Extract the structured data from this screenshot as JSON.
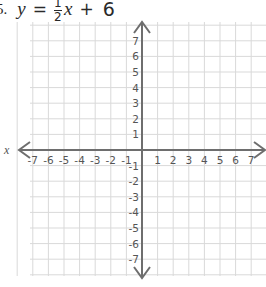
{
  "problem": {
    "number": "5.",
    "lhs": "y",
    "equals": "=",
    "fraction_numerator": "1",
    "fraction_denominator": "2",
    "variable": "x",
    "plus": "+",
    "constant": "6"
  },
  "chart_data": {
    "type": "line",
    "xlabel": "x",
    "ylabel": "",
    "xlim": [
      -7,
      7
    ],
    "ylim": [
      -7,
      7
    ],
    "grid": true,
    "x_ticks": [
      "-7",
      "-6",
      "-5",
      "-4",
      "-3",
      "-2",
      "-1",
      "1",
      "2",
      "3",
      "4",
      "5",
      "6",
      "7"
    ],
    "y_ticks": [
      "7",
      "6",
      "5",
      "4",
      "3",
      "2",
      "1",
      "-1",
      "-2",
      "-3",
      "-4",
      "-5",
      "-6",
      "-7"
    ],
    "series": [],
    "note": "Blank coordinate grid for graphing the equation; no line plotted."
  },
  "style": {
    "grid_color": "#d9d9d9",
    "axis_color": "#6e6e6e",
    "text_color": "#555555"
  }
}
